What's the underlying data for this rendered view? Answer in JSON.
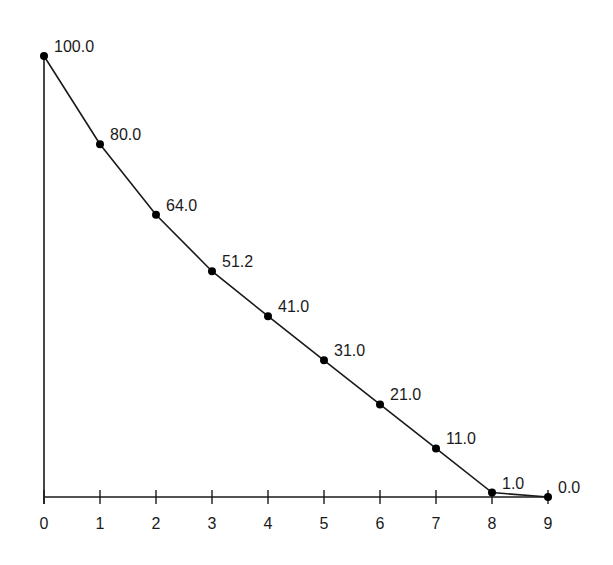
{
  "chart_data": {
    "type": "line",
    "title": "",
    "xlabel": "",
    "ylabel": "",
    "x": [
      0,
      1,
      2,
      3,
      4,
      5,
      6,
      7,
      8,
      9
    ],
    "values": [
      100.0,
      80.0,
      64.0,
      51.2,
      41.0,
      31.0,
      21.0,
      11.0,
      1.0,
      0.0
    ],
    "data_labels": [
      "100.0",
      "80.0",
      "64.0",
      "51.2",
      "41.0",
      "31.0",
      "21.0",
      "11.0",
      "1.0",
      "0.0"
    ],
    "x_tick_labels": [
      "0",
      "1",
      "2",
      "3",
      "4",
      "5",
      "6",
      "7",
      "8",
      "9"
    ],
    "ylim": [
      0,
      100
    ],
    "xlim": [
      0,
      9
    ],
    "grid": false,
    "legend": null,
    "colors": {
      "line": "#1a1a1a",
      "marker": "#000000",
      "axis": "#1a1a1a"
    }
  }
}
